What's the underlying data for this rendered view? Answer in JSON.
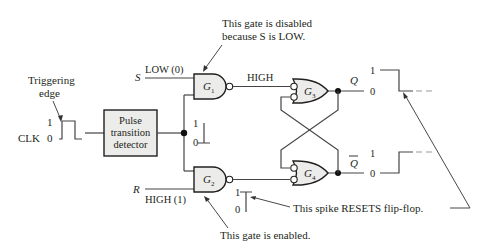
{
  "annotations": {
    "triggering_edge_line1": "Triggering",
    "triggering_edge_line2": "edge",
    "g1_disabled_line1": "This gate is disabled",
    "g1_disabled_line2": "because S is LOW.",
    "g2_enabled": "This gate is enabled.",
    "spike_resets": "This spike RESETS flip-flop."
  },
  "inputs": {
    "clk_label": "CLK",
    "clk_high": "1",
    "clk_low": "0",
    "s_label": "S",
    "s_value": "LOW (0)",
    "r_label": "R",
    "r_value": "HIGH (1)"
  },
  "blocks": {
    "detector_line1": "Pulse",
    "detector_line2": "transition",
    "detector_line3": "detector"
  },
  "gates": {
    "g1": "G",
    "g1_sub": "1",
    "g2": "G",
    "g2_sub": "2",
    "g3": "G",
    "g3_sub": "3",
    "g4": "G",
    "g4_sub": "4"
  },
  "signals": {
    "g1_output": "HIGH",
    "pulse_high": "1",
    "pulse_low": "0",
    "g2_spike_high": "1",
    "g2_spike_low": "0"
  },
  "outputs": {
    "q_label": "Q",
    "q_high": "1",
    "q_low": "0",
    "qbar_label": "Q",
    "qbar_high": "1",
    "qbar_low": "0"
  },
  "colors": {
    "gate_fill": "#ececea",
    "line": "#444444",
    "text": "#231f20"
  }
}
